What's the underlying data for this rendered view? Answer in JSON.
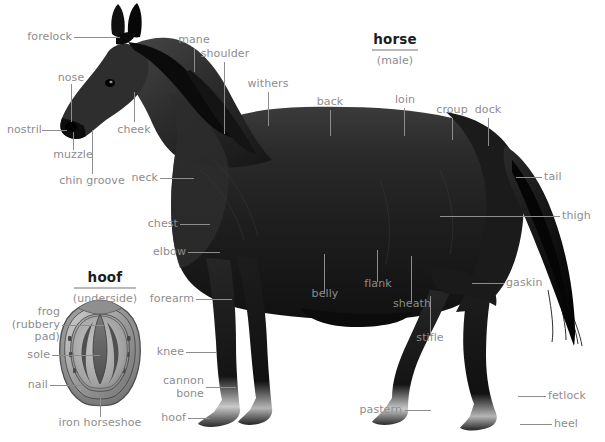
{
  "figure": {
    "background": "#ffffff",
    "label_color": "#8d8d8d",
    "title_color": "#1c1c1c",
    "rule_color": "#b9b9b9",
    "width": 605,
    "height": 442
  },
  "titles": {
    "main": {
      "word": "horse",
      "sub": "(male)"
    },
    "inset": {
      "word": "hoof",
      "sub": "(underside)"
    }
  },
  "labels": {
    "forelock": "forelock",
    "nose": "nose",
    "nostril": "nostril",
    "muzzle": "muzzle",
    "chin_groove": "chin groove",
    "cheek": "cheek",
    "neck": "neck",
    "mane": "mane",
    "shoulder": "shoulder",
    "withers": "withers",
    "back": "back",
    "loin": "loin",
    "croup": "croup",
    "dock": "dock",
    "tail": "tail",
    "thigh": "thigh",
    "gaskin": "gaskin",
    "chest": "chest",
    "elbow": "elbow",
    "forearm": "forearm",
    "knee": "knee",
    "cannon_bone": "cannon\nbone",
    "hoof": "hoof",
    "belly": "belly",
    "flank": "flank",
    "sheath": "sheath",
    "stifle": "stifle",
    "pastern": "pastern",
    "fetlock": "fetlock",
    "heel": "heel"
  },
  "inset_labels": {
    "frog": "frog\n(rubbery\npad)",
    "sole": "sole",
    "nail": "nail",
    "iron_horseshoe": "iron horseshoe"
  }
}
